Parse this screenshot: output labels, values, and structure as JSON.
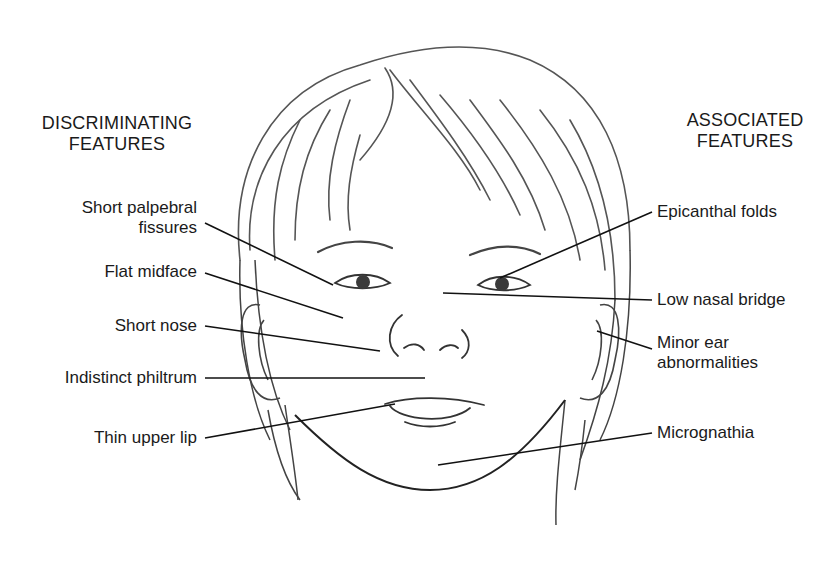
{
  "diagram": {
    "left_heading": {
      "line1": "DISCRIMINATING",
      "line2": "FEATURES"
    },
    "right_heading": {
      "line1": "ASSOCIATED",
      "line2": "FEATURES"
    },
    "left_labels": [
      {
        "line1": "Short palpebral",
        "line2": "fissures"
      },
      {
        "line1": "Flat midface"
      },
      {
        "line1": "Short nose"
      },
      {
        "line1": "Indistinct philtrum"
      },
      {
        "line1": "Thin upper lip"
      }
    ],
    "right_labels": [
      {
        "line1": "Epicanthal folds"
      },
      {
        "line1": "Low nasal bridge"
      },
      {
        "line1": "Minor ear",
        "line2": "abnormalities"
      },
      {
        "line1": "Micrognathia"
      }
    ],
    "colors": {
      "ink": "#1a1a1a",
      "sketch": "#4a4a4a",
      "background": "#ffffff"
    }
  }
}
